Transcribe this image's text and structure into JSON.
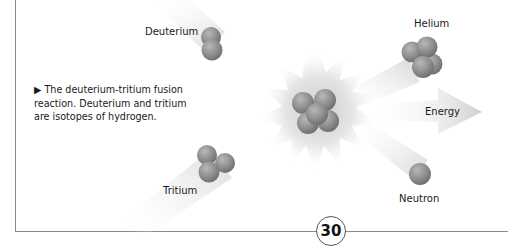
{
  "diagram": {
    "title": "Deuterium-tritium fusion reaction",
    "labels": {
      "deuterium": "Deuterium",
      "tritium": "Tritium",
      "helium": "Helium",
      "energy": "Energy",
      "neutron": "Neutron"
    },
    "caption": {
      "marker": "▶",
      "text": "The deuterium-tritium fusion reaction. Deuterium and tritium are isotopes of hydrogen."
    },
    "particle_counts": {
      "deuterium": 2,
      "tritium": 3,
      "fused_nucleus": 5,
      "helium": 4,
      "neutron": 1
    },
    "colors": {
      "sphere": "#8c8c8c",
      "sphere_highlight": "#b5b5b5",
      "glow": "#dcdcdc",
      "trail": "#e6e6e6",
      "frame": "#8a8a8a"
    }
  },
  "page": {
    "number": "30"
  }
}
